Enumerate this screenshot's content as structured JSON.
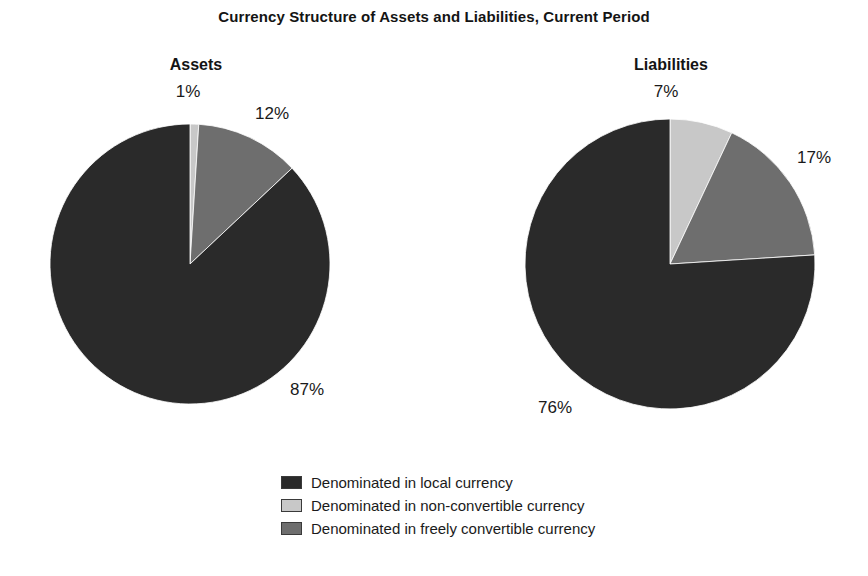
{
  "figure": {
    "title": "Currency Structure of Assets and Liabilities, Current Period",
    "background": "#ffffff"
  },
  "panels": [
    {
      "heading": "Assets"
    },
    {
      "heading": "Liabilities"
    }
  ],
  "legend": {
    "items": [
      {
        "label": "Denominated in local currency",
        "color": "#2a2a2a"
      },
      {
        "label": "Denominated in non-convertible currency",
        "color": "#c8c8c8"
      },
      {
        "label": "Denominated in freely convertible currency",
        "color": "#6e6e6e"
      }
    ]
  },
  "labels": {
    "assets": {
      "non_convertible": "1%",
      "freely_convertible": "12%",
      "local": "87%"
    },
    "liabilities": {
      "non_convertible": "7%",
      "freely_convertible": "17%",
      "local": "76%"
    }
  },
  "chart_data": [
    {
      "type": "pie",
      "title": "Assets",
      "categories": [
        "Denominated in non-convertible currency",
        "Denominated in freely convertible currency",
        "Denominated in local currency"
      ],
      "values": [
        1,
        12,
        87
      ],
      "value_labels": [
        "1%",
        "12%",
        "87%"
      ],
      "colors": [
        "#c8c8c8",
        "#6e6e6e",
        "#2a2a2a"
      ],
      "units": "percent",
      "start_angle_deg": 0,
      "direction": "clockwise",
      "legend_position": "bottom-center"
    },
    {
      "type": "pie",
      "title": "Liabilities",
      "categories": [
        "Denominated in non-convertible currency",
        "Denominated in freely convertible currency",
        "Denominated in local currency"
      ],
      "values": [
        7,
        17,
        76
      ],
      "value_labels": [
        "7%",
        "17%",
        "76%"
      ],
      "colors": [
        "#c8c8c8",
        "#6e6e6e",
        "#2a2a2a"
      ],
      "units": "percent",
      "start_angle_deg": 0,
      "direction": "clockwise",
      "legend_position": "bottom-center"
    }
  ]
}
